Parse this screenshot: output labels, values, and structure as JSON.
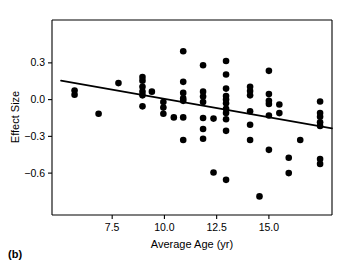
{
  "panel": {
    "label": "(b)"
  },
  "chart_data": {
    "type": "scatter",
    "title": "",
    "xlabel": "Average Age (yr)",
    "ylabel": "Effect Size",
    "xlim": [
      4.62,
      18.02
    ],
    "ylim": [
      -0.942,
      0.65
    ],
    "xticks": [
      7.5,
      10.0,
      12.5,
      15.0
    ],
    "xticklabels": [
      "7.5",
      "10.0",
      "12.5",
      "15.0"
    ],
    "yticks": [
      0.3,
      0.0,
      -0.3,
      -0.6
    ],
    "yticklabels": [
      "0.3",
      "0.0",
      "−0.3",
      "−0.6"
    ],
    "grid": false,
    "legend": null,
    "marker": {
      "shape": "circle",
      "color": "#000000",
      "size": 4.6
    },
    "points": [
      {
        "x": 5.7,
        "y": 0.075
      },
      {
        "x": 5.7,
        "y": 0.04
      },
      {
        "x": 6.85,
        "y": -0.115
      },
      {
        "x": 7.8,
        "y": 0.135
      },
      {
        "x": 8.95,
        "y": 0.185
      },
      {
        "x": 8.95,
        "y": 0.155
      },
      {
        "x": 8.95,
        "y": 0.105
      },
      {
        "x": 8.95,
        "y": 0.065
      },
      {
        "x": 8.95,
        "y": 0.035
      },
      {
        "x": 8.95,
        "y": -0.055
      },
      {
        "x": 9.4,
        "y": 0.065
      },
      {
        "x": 9.95,
        "y": -0.02
      },
      {
        "x": 9.95,
        "y": -0.065
      },
      {
        "x": 9.95,
        "y": -0.115
      },
      {
        "x": 10.45,
        "y": -0.145
      },
      {
        "x": 10.9,
        "y": 0.395
      },
      {
        "x": 10.9,
        "y": 0.145
      },
      {
        "x": 10.9,
        "y": 0.055
      },
      {
        "x": 10.9,
        "y": 0.01
      },
      {
        "x": 10.9,
        "y": -0.01
      },
      {
        "x": 10.9,
        "y": -0.145
      },
      {
        "x": 10.9,
        "y": -0.33
      },
      {
        "x": 11.85,
        "y": 0.28
      },
      {
        "x": 11.85,
        "y": 0.065
      },
      {
        "x": 11.85,
        "y": 0.025
      },
      {
        "x": 11.85,
        "y": -0.02
      },
      {
        "x": 11.85,
        "y": -0.15
      },
      {
        "x": 11.85,
        "y": -0.24
      },
      {
        "x": 11.85,
        "y": -0.32
      },
      {
        "x": 12.35,
        "y": -0.155
      },
      {
        "x": 12.35,
        "y": -0.595
      },
      {
        "x": 12.95,
        "y": 0.315
      },
      {
        "x": 12.95,
        "y": 0.205
      },
      {
        "x": 12.95,
        "y": 0.09
      },
      {
        "x": 12.95,
        "y": 0.03
      },
      {
        "x": 12.95,
        "y": 0.0
      },
      {
        "x": 12.95,
        "y": -0.03
      },
      {
        "x": 12.95,
        "y": -0.075
      },
      {
        "x": 12.95,
        "y": -0.11
      },
      {
        "x": 12.95,
        "y": -0.16
      },
      {
        "x": 12.95,
        "y": -0.255
      },
      {
        "x": 12.95,
        "y": -0.655
      },
      {
        "x": 14.1,
        "y": 0.105
      },
      {
        "x": 14.1,
        "y": 0.07
      },
      {
        "x": 14.1,
        "y": 0.035
      },
      {
        "x": 14.1,
        "y": -0.095
      },
      {
        "x": 14.1,
        "y": -0.205
      },
      {
        "x": 14.1,
        "y": -0.33
      },
      {
        "x": 14.55,
        "y": -0.79
      },
      {
        "x": 15.0,
        "y": 0.235
      },
      {
        "x": 15.0,
        "y": 0.045
      },
      {
        "x": 15.0,
        "y": -0.01
      },
      {
        "x": 15.0,
        "y": -0.035
      },
      {
        "x": 15.0,
        "y": -0.13
      },
      {
        "x": 15.0,
        "y": -0.41
      },
      {
        "x": 15.5,
        "y": -0.04
      },
      {
        "x": 15.5,
        "y": -0.11
      },
      {
        "x": 15.95,
        "y": -0.475
      },
      {
        "x": 15.95,
        "y": -0.6
      },
      {
        "x": 16.5,
        "y": -0.33
      },
      {
        "x": 17.45,
        "y": -0.015
      },
      {
        "x": 17.45,
        "y": -0.11
      },
      {
        "x": 17.45,
        "y": -0.14
      },
      {
        "x": 17.45,
        "y": -0.185
      },
      {
        "x": 17.45,
        "y": -0.215
      },
      {
        "x": 17.45,
        "y": -0.485
      },
      {
        "x": 17.45,
        "y": -0.525
      }
    ],
    "fit_line": {
      "type": "linear-regression",
      "x_start": 5.05,
      "y_start": 0.155,
      "x_end": 18.02,
      "y_end": -0.235
    }
  }
}
